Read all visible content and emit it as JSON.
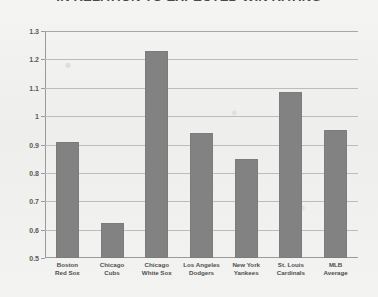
{
  "chart_data": {
    "type": "bar",
    "title": "IN RELATION TO EXPECTED WIN RATING",
    "xlabel": "",
    "ylabel": "",
    "ylim": [
      0.5,
      1.3
    ],
    "grid": true,
    "legend": "none",
    "orientation": "vertical",
    "bar_color": "#828282",
    "yticks": [
      "0.5",
      "0.6",
      "0.7",
      "0.8",
      "0.9",
      "1",
      "1.1",
      "1.2",
      "1.3"
    ],
    "ytick_values": [
      0.5,
      0.6,
      0.7,
      0.8,
      0.9,
      1.0,
      1.1,
      1.2,
      1.3
    ],
    "categories": [
      "Boston Red Sox",
      "Chicago Cubs",
      "Chicago White Sox",
      "Los Angeles Dodgers",
      "New York Yankees",
      "St. Louis Cardinals",
      "MLB Average"
    ],
    "category_lines": [
      [
        "Boston",
        "Red Sox"
      ],
      [
        "Chicago",
        "Cubs"
      ],
      [
        "Chicago",
        "White Sox"
      ],
      [
        "Los Angeles",
        "Dodgers"
      ],
      [
        "New York",
        "Yankees"
      ],
      [
        "St. Louis",
        "Cardinals"
      ],
      [
        "MLB",
        "Average"
      ]
    ],
    "values": [
      0.91,
      0.625,
      1.23,
      0.94,
      0.85,
      1.085,
      0.95
    ]
  },
  "figure": {
    "background": "#f2f2f0",
    "axis_color": "#9a9a9a",
    "gridline_color": "#bcbcbc",
    "text_color": "#4f4f4f"
  }
}
